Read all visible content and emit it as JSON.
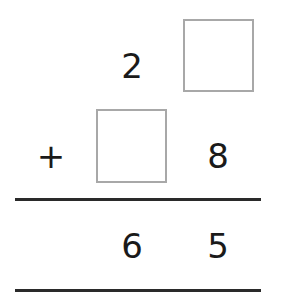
{
  "problem": {
    "type": "vertical-addition",
    "row1": {
      "tens": "2",
      "ones": ""
    },
    "row2": {
      "operator": "+",
      "tens": "",
      "ones": "8"
    },
    "result": {
      "tens": "6",
      "ones": "5"
    }
  },
  "colors": {
    "text": "#1a1a1a",
    "box_border": "#a8a8a8",
    "rule": "#2a2a2a"
  }
}
